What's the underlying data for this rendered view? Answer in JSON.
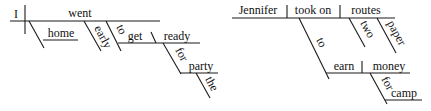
{
  "diagrams": [
    {
      "name": "sentence-1",
      "subject": "I",
      "verb": "went",
      "modifiers": {
        "adverb_1": "home",
        "adverb_2": "early",
        "infinitive_marker": "to",
        "infinitive_verb": "get",
        "complement": "ready",
        "preposition": "for",
        "prep_object": "party",
        "article": "the"
      }
    },
    {
      "name": "sentence-2",
      "subject": "Jennifer",
      "verb": "took on",
      "object": "routes",
      "modifiers": {
        "adjective_1": "two",
        "adjective_2": "paper",
        "infinitive_marker": "to",
        "infinitive_verb": "earn",
        "infinitive_object": "money",
        "preposition": "for",
        "prep_object": "camp"
      }
    }
  ]
}
